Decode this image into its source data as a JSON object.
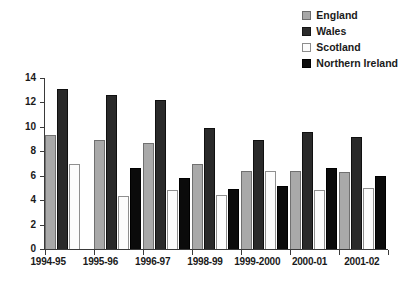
{
  "chart_data": {
    "type": "bar",
    "title": "",
    "xlabel": "",
    "ylabel": "",
    "ylim": [
      0,
      14
    ],
    "yticks": [
      0,
      2,
      4,
      6,
      8,
      10,
      12,
      14
    ],
    "grid": false,
    "legend_position": "top-right",
    "categories": [
      "1994-95",
      "1995-96",
      "1996-97",
      "1998-99",
      "1999-2000",
      "2000-01",
      "2001-02"
    ],
    "series": [
      {
        "name": "England",
        "color": "#a9a9a9",
        "values": [
          9.3,
          8.9,
          8.7,
          7.0,
          6.4,
          6.4,
          6.3
        ]
      },
      {
        "name": "Wales",
        "color": "#2a2a2a",
        "values": [
          13.1,
          12.6,
          12.2,
          9.9,
          8.9,
          9.6,
          9.2
        ]
      },
      {
        "name": "Scotland",
        "color": "#fcfcfc",
        "values": [
          7.0,
          4.3,
          4.8,
          4.4,
          6.4,
          4.8,
          5.0
        ]
      },
      {
        "name": "Northern Ireland",
        "color": "#0b0b0b",
        "values": [
          null,
          6.6,
          5.8,
          4.9,
          5.2,
          6.6,
          6.0
        ]
      }
    ]
  },
  "legend": {
    "items": [
      {
        "label": "England"
      },
      {
        "label": "Wales"
      },
      {
        "label": "Scotland"
      },
      {
        "label": "Northern Ireland"
      }
    ]
  },
  "title_strip": {
    "text": ""
  }
}
